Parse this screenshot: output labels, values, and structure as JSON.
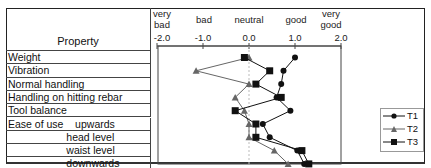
{
  "chart_data": {
    "type": "line",
    "orientation": "horizontal-profile",
    "title": "",
    "xlabel": "",
    "ylabel": "Property",
    "xlim": [
      -2.0,
      2.0
    ],
    "x_ticks": [
      "-2.0",
      "-1.0",
      "0.0",
      "1.0",
      "2.0"
    ],
    "scale_labels": [
      "very bad",
      "bad",
      "neutral",
      "good",
      "very good"
    ],
    "categories": [
      "Weight",
      "Vibration",
      "Normal handling",
      "Handling on hitting rebar",
      "Tool balance",
      "Ease of use   upwards",
      "head level",
      "waist level",
      "downwards"
    ],
    "series": [
      {
        "name": "T1",
        "marker": "circle",
        "values": [
          1.0,
          0.75,
          0.7,
          0.6,
          0.9,
          0.3,
          0.45,
          1.05,
          1.2
        ]
      },
      {
        "name": "T2",
        "marker": "triangle",
        "values": [
          0.0,
          -1.15,
          0.0,
          -0.3,
          -0.1,
          0.0,
          0.0,
          0.55,
          0.85
        ]
      },
      {
        "name": "T3",
        "marker": "square",
        "values": [
          -0.1,
          0.45,
          0.15,
          0.7,
          -0.3,
          0.15,
          0.15,
          1.15,
          1.3
        ]
      }
    ],
    "legend_position": "right",
    "grid": false
  },
  "table": {
    "header": "Property",
    "rows": [
      "Weight",
      "Vibration",
      "Normal handling",
      "Handling on hitting rebar",
      "Tool balance",
      "Ease of use    upwards",
      "                    head level",
      "                    waist level",
      "                    downwards"
    ]
  },
  "scale": {
    "very_bad": "very\nbad",
    "bad": "bad",
    "neutral": "neutral",
    "good": "good",
    "very_good": "very\ngood",
    "ticks": [
      "-2.0",
      "-1.0",
      "0.0",
      "1.0",
      "2.0"
    ]
  },
  "legend": {
    "items": [
      "T1",
      "T2",
      "T3"
    ]
  },
  "colors": {
    "t1": "#111111",
    "t2": "#666666",
    "t3": "#111111"
  }
}
